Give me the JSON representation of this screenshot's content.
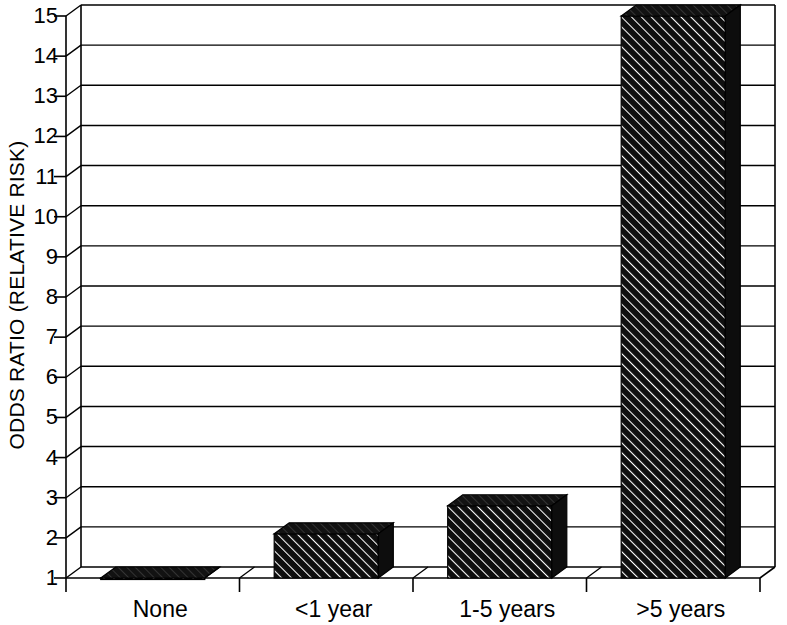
{
  "chart_data": {
    "type": "bar",
    "title": "",
    "subtitle": "",
    "xlabel": "",
    "ylabel": "ODDS RATIO (RELATIVE RISK)",
    "categories": [
      "None",
      "<1 year",
      "1-5 years",
      ">5 years"
    ],
    "values": [
      1.0,
      2.1,
      2.8,
      15.0
    ],
    "series": [
      {
        "name": "Odds ratio",
        "values": [
          1.0,
          2.1,
          2.8,
          15.0
        ]
      }
    ],
    "ylim": [
      1,
      15
    ],
    "y_ticks": [
      1,
      2,
      3,
      4,
      5,
      6,
      7,
      8,
      9,
      10,
      11,
      12,
      13,
      14,
      15
    ],
    "y_tick_labels": [
      "1",
      "2",
      "3",
      "4",
      "5",
      "6",
      "7",
      "8",
      "9",
      "10",
      "11",
      "12",
      "13",
      "14",
      "15"
    ],
    "grid": true,
    "grid_axis": "y",
    "legend": false,
    "legend_position": "none",
    "annotations": [],
    "style": {
      "three_d": true,
      "bar_fill": "#1a1a1a",
      "bar_hatch": "diagonal",
      "bar_top_face": "#141414",
      "bar_side_face": "#0d0d0d",
      "axis_color": "#000000",
      "grid_color": "#333333",
      "background": "#ffffff",
      "text_color": "#000000"
    }
  },
  "axes": {
    "y_title": "ODDS RATIO (RELATIVE RISK)"
  }
}
